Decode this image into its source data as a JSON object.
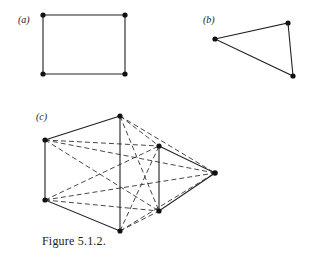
{
  "figure": {
    "caption": "Figure 5.1.2.",
    "panels": [
      {
        "label": "(a)",
        "shape": "rectangle (4-cycle)",
        "vertices": [
          [
            43,
            15
          ],
          [
            125,
            15
          ],
          [
            125,
            74
          ],
          [
            43,
            74
          ]
        ],
        "solid_edges": [
          [
            0,
            1
          ],
          [
            1,
            2
          ],
          [
            2,
            3
          ],
          [
            3,
            0
          ]
        ],
        "dashed_edges": []
      },
      {
        "label": "(b)",
        "shape": "triangle (3-cycle)",
        "vertices": [
          [
            215,
            39
          ],
          [
            288,
            23
          ],
          [
            293,
            76
          ]
        ],
        "solid_edges": [
          [
            0,
            1
          ],
          [
            1,
            2
          ],
          [
            2,
            0
          ]
        ],
        "dashed_edges": []
      },
      {
        "label": "(c)",
        "shape": "two cycles with dashed cross edges",
        "vertices": [
          [
            45,
            140
          ],
          [
            120,
            116
          ],
          [
            159,
            146
          ],
          [
            215,
            173
          ],
          [
            159,
            211
          ],
          [
            120,
            231
          ],
          [
            45,
            200
          ]
        ],
        "solid_edges": [
          [
            0,
            1
          ],
          [
            1,
            5
          ],
          [
            5,
            6
          ],
          [
            6,
            0
          ],
          [
            2,
            3
          ],
          [
            3,
            4
          ],
          [
            4,
            2
          ]
        ],
        "dashed_edges": [
          [
            1,
            2
          ],
          [
            1,
            3
          ],
          [
            1,
            4
          ],
          [
            5,
            2
          ],
          [
            5,
            3
          ],
          [
            5,
            4
          ],
          [
            0,
            2
          ],
          [
            0,
            3
          ],
          [
            0,
            4
          ],
          [
            6,
            2
          ],
          [
            6,
            3
          ],
          [
            6,
            4
          ]
        ]
      }
    ]
  }
}
